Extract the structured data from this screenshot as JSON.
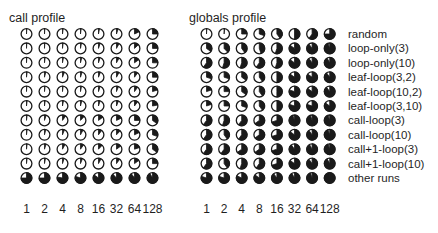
{
  "colors": {
    "ink": "#1a1a1a",
    "background": "#ffffff"
  },
  "chart_data": [
    {
      "type": "heatmap",
      "mark": "pie",
      "title": "call profile",
      "xlabel": "",
      "ylabel": "",
      "x": [
        "1",
        "2",
        "4",
        "8",
        "16",
        "32",
        "64",
        "128"
      ],
      "y": [
        "random",
        "loop-only(3)",
        "loop-only(10)",
        "leaf-loop(3,2)",
        "leaf-loop(10,2)",
        "leaf-loop(3,10)",
        "call-loop(3)",
        "call-loop(10)",
        "call+1-loop(3)",
        "call+1-loop(10)",
        "other runs"
      ],
      "value_range": [
        0,
        1
      ],
      "values": [
        [
          0.01,
          0.01,
          0.02,
          0.02,
          0.03,
          0.05,
          0.18,
          0.25
        ],
        [
          0.01,
          0.01,
          0.02,
          0.03,
          0.05,
          0.08,
          0.13,
          0.25
        ],
        [
          0.01,
          0.02,
          0.03,
          0.04,
          0.05,
          0.08,
          0.15,
          0.25
        ],
        [
          0.02,
          0.04,
          0.06,
          0.05,
          0.06,
          0.08,
          0.1,
          0.25
        ],
        [
          0.01,
          0.02,
          0.02,
          0.03,
          0.05,
          0.06,
          0.1,
          0.2
        ],
        [
          0.02,
          0.02,
          0.03,
          0.04,
          0.05,
          0.06,
          0.1,
          0.22
        ],
        [
          0.02,
          0.05,
          0.1,
          0.12,
          0.15,
          0.18,
          0.25,
          0.35
        ],
        [
          0.02,
          0.04,
          0.06,
          0.08,
          0.1,
          0.12,
          0.18,
          0.3
        ],
        [
          0.02,
          0.05,
          0.08,
          0.1,
          0.12,
          0.15,
          0.2,
          0.35
        ],
        [
          0.02,
          0.03,
          0.05,
          0.06,
          0.08,
          0.1,
          0.15,
          0.25
        ],
        [
          0.75,
          0.75,
          0.78,
          0.8,
          0.85,
          0.88,
          0.9,
          0.92
        ]
      ]
    },
    {
      "type": "heatmap",
      "mark": "pie",
      "title": "globals profile",
      "xlabel": "",
      "ylabel": "",
      "x": [
        "1",
        "2",
        "4",
        "8",
        "16",
        "32",
        "64",
        "128"
      ],
      "y": [
        "random",
        "loop-only(3)",
        "loop-only(10)",
        "leaf-loop(3,2)",
        "leaf-loop(10,2)",
        "leaf-loop(3,10)",
        "call-loop(3)",
        "call-loop(10)",
        "call+1-loop(3)",
        "call+1-loop(10)",
        "other runs"
      ],
      "value_range": [
        0,
        1
      ],
      "legend": "right",
      "values": [
        [
          0.01,
          0.02,
          0.25,
          0.3,
          0.4,
          0.5,
          0.6,
          0.75
        ],
        [
          0.35,
          0.38,
          0.4,
          0.45,
          0.55,
          0.85,
          0.9,
          0.95
        ],
        [
          0.6,
          0.55,
          0.55,
          0.6,
          0.55,
          0.85,
          0.9,
          0.92
        ],
        [
          0.3,
          0.3,
          0.35,
          0.4,
          0.5,
          0.85,
          0.85,
          0.9
        ],
        [
          0.2,
          0.25,
          0.35,
          0.4,
          0.5,
          0.8,
          0.85,
          0.9
        ],
        [
          0.2,
          0.25,
          0.3,
          0.4,
          0.5,
          0.8,
          0.8,
          0.85
        ],
        [
          0.6,
          0.55,
          0.6,
          0.65,
          0.7,
          0.95,
          0.95,
          0.95
        ],
        [
          0.6,
          0.4,
          0.6,
          0.65,
          0.7,
          0.85,
          0.9,
          0.95
        ],
        [
          0.6,
          0.6,
          0.65,
          0.65,
          0.7,
          0.9,
          0.92,
          0.95
        ],
        [
          0.6,
          0.4,
          0.55,
          0.6,
          0.7,
          0.85,
          0.9,
          0.92
        ],
        [
          0.8,
          0.8,
          0.82,
          0.85,
          0.9,
          0.92,
          0.95,
          0.99
        ]
      ]
    }
  ]
}
